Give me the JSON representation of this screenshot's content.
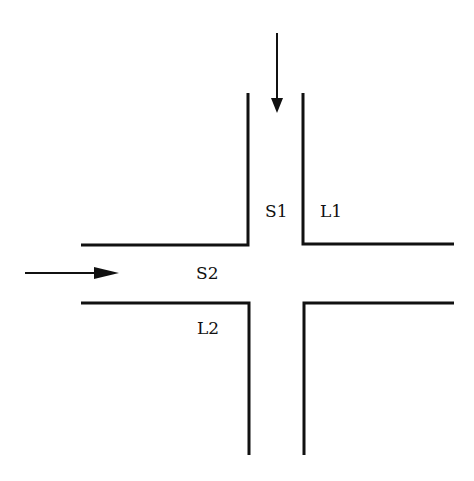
{
  "diagram": {
    "type": "intersection",
    "labels": {
      "s1": "S1",
      "l1": "L1",
      "s2": "S2",
      "l2": "L2"
    },
    "arrows": [
      {
        "name": "southbound-flow",
        "direction": "down"
      },
      {
        "name": "eastbound-flow",
        "direction": "right"
      }
    ],
    "colors": {
      "stroke": "#111111",
      "background": "#ffffff"
    }
  }
}
